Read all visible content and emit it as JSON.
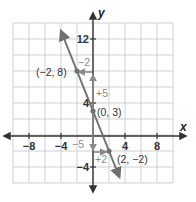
{
  "chart_data": {
    "type": "line",
    "title": "",
    "xlabel": "x",
    "ylabel": "y",
    "xlim": [
      -10,
      10
    ],
    "ylim": [
      -6,
      14
    ],
    "grid": true,
    "grid_step": 2,
    "x_ticks": [
      -8,
      -4,
      4,
      8
    ],
    "x_tick_labels": [
      "−8",
      "−4",
      "4",
      "8"
    ],
    "y_ticks": [
      12,
      4,
      -4
    ],
    "y_tick_labels": [
      "12",
      "4",
      "−4"
    ],
    "series": [
      {
        "name": "line",
        "equation": "y = -2.5x + 3",
        "x": [
          -2,
          0,
          2
        ],
        "y": [
          8,
          3,
          -2
        ]
      }
    ],
    "points": [
      {
        "x": -2,
        "y": 8,
        "label": "(−2, 8)"
      },
      {
        "x": 0,
        "y": 3,
        "label": "(0, 3)"
      },
      {
        "x": 2,
        "y": -2,
        "label": "(2, −2)"
      }
    ],
    "annotations": [
      {
        "text": "−2",
        "meaning": "run from (0,8) to (-2,8)"
      },
      {
        "text": "+5",
        "meaning": "rise from (0,3) to (0,8)"
      },
      {
        "text": "−5",
        "meaning": "fall from (0,3) to (0,-2)"
      },
      {
        "text": "+2",
        "meaning": "run from (0,-2) to (2,-2)"
      }
    ],
    "colors": {
      "line": "#707070",
      "axes": "#333333",
      "grid": "#cfcfcf",
      "annotation_arrow": "#8a8a8a"
    }
  }
}
